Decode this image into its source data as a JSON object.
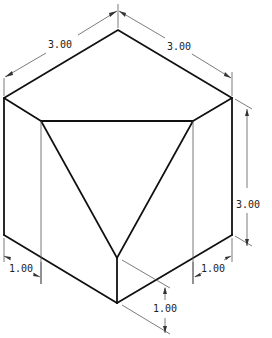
{
  "drawing": {
    "type": "isometric technical drawing",
    "subject": "cube with truncated corner (triangular cut face)",
    "dimensions": {
      "top_left_edge": "3.00",
      "top_right_edge": "3.00",
      "right_height": "3.00",
      "left_cut_depth": "1.00",
      "right_cut_depth": "1.00",
      "bottom_cut_height": "1.00"
    }
  }
}
